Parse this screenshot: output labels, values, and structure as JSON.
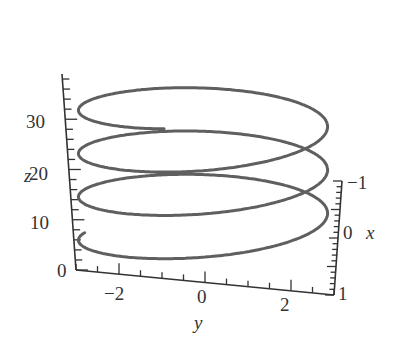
{
  "chart_data": {
    "type": "line3d",
    "title": "",
    "xlabel": "x",
    "ylabel": "y",
    "zlabel": "z",
    "x_ticks": [
      "-1",
      "0",
      "1"
    ],
    "y_ticks": [
      "-2",
      "0",
      "2"
    ],
    "z_ticks": [
      "0",
      "10",
      "20",
      "30"
    ],
    "xlim": [
      -1,
      1
    ],
    "ylim": [
      -3,
      3
    ],
    "zlim": [
      0,
      39
    ],
    "grid": false,
    "legend": null,
    "series": [
      {
        "name": "helix",
        "param": "t",
        "x": "cos(t)",
        "y": "3 sin(t)",
        "z_start": 10,
        "z_end": 38,
        "turns": 3.25,
        "color": "#5f5f5f"
      }
    ]
  },
  "labels": {
    "z_axis": "z",
    "y_axis": "y",
    "x_axis": "x",
    "z_tick_0": "0",
    "z_tick_10": "10",
    "z_tick_20": "20",
    "z_tick_30": "30",
    "y_tick_neg2": "−2",
    "y_tick_0": "0",
    "y_tick_2": "2",
    "x_tick_neg1": "−1",
    "x_tick_0": "0",
    "x_tick_1": "1"
  },
  "colors": {
    "curve": "#5f5f5f",
    "axis": "#333333"
  }
}
